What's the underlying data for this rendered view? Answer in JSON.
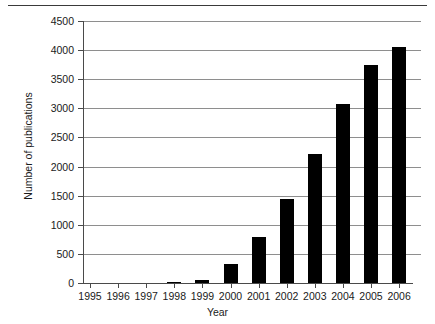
{
  "chart_data": {
    "type": "bar",
    "title": "",
    "subtitle": "",
    "xlabel": "Year",
    "ylabel": "Number of publications",
    "categories": [
      "1995",
      "1996",
      "1997",
      "1998",
      "1999",
      "2000",
      "2001",
      "2002",
      "2003",
      "2004",
      "2005",
      "2006"
    ],
    "values": [
      0,
      0,
      0,
      20,
      60,
      330,
      790,
      1450,
      2220,
      3070,
      3740,
      4050
    ],
    "ylim": [
      0,
      4500
    ],
    "yticks": [
      0,
      500,
      1000,
      1500,
      2000,
      2500,
      3000,
      3500,
      4000,
      4500
    ],
    "ytick_labels": [
      "0",
      "500",
      "1000",
      "1500",
      "2000",
      "2500",
      "3000",
      "3500",
      "4000",
      "4500"
    ],
    "grid": true,
    "grid_axis": "y",
    "legend": false,
    "legend_position": "none",
    "bar_color": "#000000",
    "grid_color": "#8e8e8e",
    "axis_color": "#4a4a4a",
    "annotations": []
  }
}
